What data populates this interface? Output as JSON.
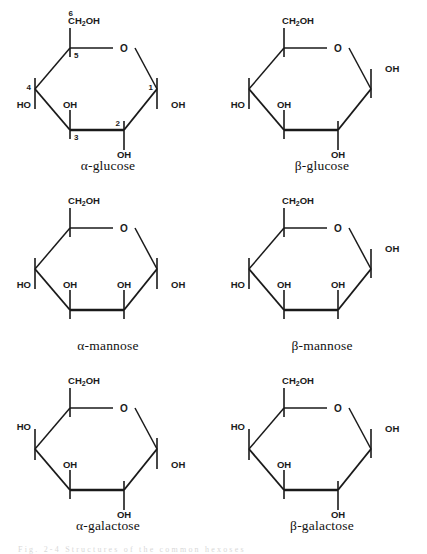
{
  "figure": {
    "caption_fragment": "Fig. 2-4  Structures of the common hexoses",
    "background": "#ffffff",
    "ink": "#1a1a1a"
  },
  "labels": {
    "ring_oxygen": "O",
    "hydroxyl": "OH",
    "hydroxyl_left": "HO",
    "ch2oh": "CH",
    "ch2oh_sub": "2",
    "ch2oh_tail": "OH"
  },
  "molecules": [
    {
      "id": "alpha-glucose",
      "name": "α-glucose",
      "numbered": true,
      "carbon_numbers": {
        "c1": "1",
        "c2": "2",
        "c3": "3",
        "c4": "4",
        "c5": "5",
        "c6": "6"
      },
      "substituents": {
        "c1": {
          "group": "OH",
          "direction": "down"
        },
        "c2": {
          "group": "OH",
          "direction": "down"
        },
        "c3": {
          "group": "OH",
          "direction": "up"
        },
        "c4": {
          "group": "HO",
          "direction": "down"
        },
        "c5": {
          "group": "CH2OH",
          "direction": "up"
        }
      }
    },
    {
      "id": "beta-glucose",
      "name": "β-glucose",
      "numbered": false,
      "substituents": {
        "c1": {
          "group": "OH",
          "direction": "up"
        },
        "c2": {
          "group": "OH",
          "direction": "down"
        },
        "c3": {
          "group": "OH",
          "direction": "up"
        },
        "c4": {
          "group": "HO",
          "direction": "down"
        },
        "c5": {
          "group": "CH2OH",
          "direction": "up"
        }
      }
    },
    {
      "id": "alpha-mannose",
      "name": "α-mannose",
      "numbered": false,
      "substituents": {
        "c1": {
          "group": "OH",
          "direction": "down"
        },
        "c2": {
          "group": "OH",
          "direction": "up"
        },
        "c3": {
          "group": "OH",
          "direction": "up"
        },
        "c4": {
          "group": "HO",
          "direction": "down"
        },
        "c5": {
          "group": "CH2OH",
          "direction": "up"
        }
      }
    },
    {
      "id": "beta-mannose",
      "name": "β-mannose",
      "numbered": false,
      "substituents": {
        "c1": {
          "group": "OH",
          "direction": "up"
        },
        "c2": {
          "group": "OH",
          "direction": "up"
        },
        "c3": {
          "group": "OH",
          "direction": "up"
        },
        "c4": {
          "group": "HO",
          "direction": "down"
        },
        "c5": {
          "group": "CH2OH",
          "direction": "up"
        }
      }
    },
    {
      "id": "alpha-galactose",
      "name": "α-galactose",
      "numbered": false,
      "substituents": {
        "c1": {
          "group": "OH",
          "direction": "down"
        },
        "c2": {
          "group": "OH",
          "direction": "down"
        },
        "c3": {
          "group": "OH",
          "direction": "up"
        },
        "c4": {
          "group": "HO",
          "direction": "up"
        },
        "c5": {
          "group": "CH2OH",
          "direction": "up"
        }
      }
    },
    {
      "id": "beta-galactose",
      "name": "β-galactose",
      "numbered": false,
      "substituents": {
        "c1": {
          "group": "OH",
          "direction": "up"
        },
        "c2": {
          "group": "OH",
          "direction": "down"
        },
        "c3": {
          "group": "OH",
          "direction": "up"
        },
        "c4": {
          "group": "HO",
          "direction": "up"
        },
        "c5": {
          "group": "CH2OH",
          "direction": "up"
        }
      }
    }
  ]
}
